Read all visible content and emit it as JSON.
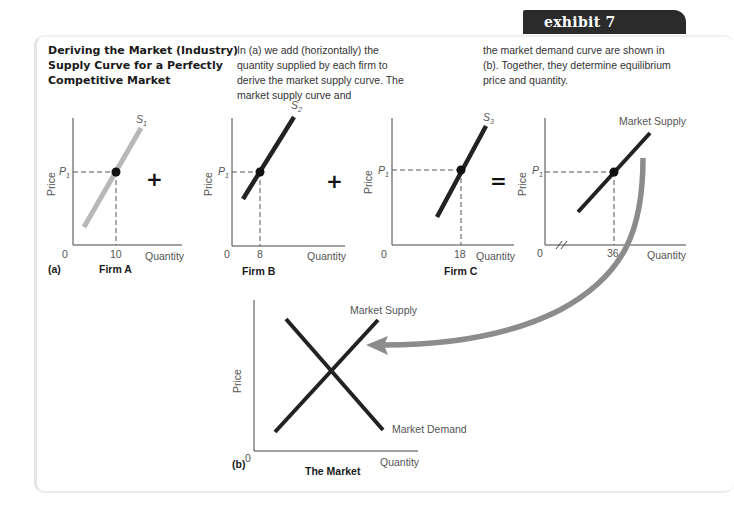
{
  "header": {
    "exhibit_label": "exhibit 7"
  },
  "caption": {
    "title": "Deriving the Market (Industry) Supply Curve for a Perfectly Competitive Market",
    "description_col1": "In (a) we add (horizontally) the quantity supplied by each firm to derive the market supply curve. The market supply curve and",
    "description_col2": "the market demand curve are shown in (b). Together, they determine equilibrium price and quantity."
  },
  "panel_a": {
    "part_label": "(a)",
    "operators": [
      "+",
      "+",
      "="
    ],
    "firms": [
      {
        "name": "Firm A",
        "curve_label": "S",
        "curve_sub": "1",
        "quantity": "10",
        "price_label": "P",
        "price_sub": "1",
        "y_axis": "Price",
        "x_axis": "Quantity",
        "origin": "0"
      },
      {
        "name": "Firm B",
        "curve_label": "S",
        "curve_sub": "2",
        "quantity": "8",
        "price_label": "P",
        "price_sub": "1",
        "y_axis": "Price",
        "x_axis": "Quantity",
        "origin": "0"
      },
      {
        "name": "Firm C",
        "curve_label": "S",
        "curve_sub": "3",
        "quantity": "18",
        "price_label": "P",
        "price_sub": "1",
        "y_axis": "Price",
        "x_axis": "Quantity",
        "origin": "0"
      },
      {
        "name": "",
        "curve_label": "Market Supply",
        "curve_sub": "",
        "quantity": "36",
        "price_label": "P",
        "price_sub": "1",
        "y_axis": "Price",
        "x_axis": "Quantity",
        "origin": "0"
      }
    ]
  },
  "panel_b": {
    "part_label": "(b)",
    "name": "The Market",
    "supply_label": "Market Supply",
    "demand_label": "Market Demand",
    "y_axis": "Price",
    "x_axis": "Quantity",
    "origin": "0"
  },
  "colors": {
    "curve_dark": "#222222",
    "curve_firm_a": "#b8b8b8",
    "arrow": "#8c8c8c",
    "tab_bg": "#2b2b2b"
  }
}
